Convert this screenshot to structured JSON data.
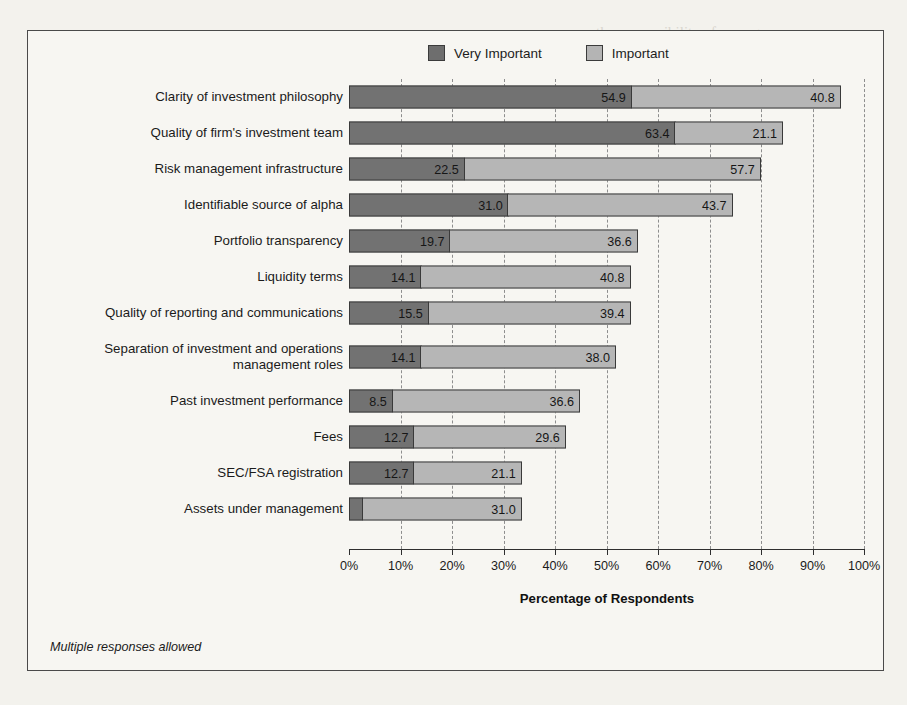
{
  "legend": {
    "items": [
      {
        "label": "Very Important",
        "color": "#727272"
      },
      {
        "label": "Important",
        "color": "#b6b6b6"
      }
    ]
  },
  "footnote": "Multiple responses allowed",
  "chart_data": {
    "type": "bar",
    "orientation": "horizontal",
    "stacked": true,
    "title": "",
    "xlabel": "Percentage of Respondents",
    "ylabel": "",
    "xlim": [
      0,
      100
    ],
    "xticks": [
      "0%",
      "10%",
      "20%",
      "30%",
      "40%",
      "50%",
      "60%",
      "70%",
      "80%",
      "90%",
      "100%"
    ],
    "xtick_values": [
      0,
      10,
      20,
      30,
      40,
      50,
      60,
      70,
      80,
      90,
      100
    ],
    "grid": "vertical-dashed",
    "legend_position": "top-center",
    "categories": [
      "Clarity of investment philosophy",
      "Quality of firm's investment team",
      "Risk management infrastructure",
      "Identifiable source of alpha",
      "Portfolio transparency",
      "Liquidity terms",
      "Quality of reporting and communications",
      "Separation of investment and operations management roles",
      "Past investment performance",
      "Fees",
      "SEC/FSA registration",
      "Assets under management"
    ],
    "series": [
      {
        "name": "Very Important",
        "color": "#727272",
        "values": [
          54.9,
          63.4,
          22.5,
          31.0,
          19.7,
          14.1,
          15.5,
          14.1,
          8.5,
          12.7,
          12.7,
          2.8
        ],
        "labels": [
          "54.9",
          "63.4",
          "22.5",
          "31.0",
          "19.7",
          "14.1",
          "15.5",
          "14.1",
          "8.5",
          "12.7",
          "12.7",
          ""
        ]
      },
      {
        "name": "Important",
        "color": "#b6b6b6",
        "values": [
          40.8,
          21.1,
          57.7,
          43.7,
          36.6,
          40.8,
          39.4,
          38.0,
          36.6,
          29.6,
          21.1,
          31.0
        ],
        "labels": [
          "40.8",
          "21.1",
          "57.7",
          "43.7",
          "36.6",
          "40.8",
          "39.4",
          "38.0",
          "36.6",
          "29.6",
          "21.1",
          "31.0"
        ]
      }
    ]
  },
  "bleed_text": [
    {
      "t": "the responsibility of manager",
      "x": 596,
      "y": 24,
      "s": 15
    },
    {
      "t": "Public funds",
      "x": 600,
      "y": 92,
      "s": 15
    },
    {
      "t": "or assets of the",
      "x": 612,
      "y": 152,
      "s": 15
    },
    {
      "t": "such that the",
      "x": 600,
      "y": 212,
      "s": 15
    },
    {
      "t": "(DIP) have required",
      "x": 596,
      "y": 268,
      "s": 15
    },
    {
      "t": "operational risk",
      "x": 598,
      "y": 310,
      "s": 15
    },
    {
      "t": "BUILDING A PROGRAM",
      "x": 596,
      "y": 424,
      "s": 18
    },
    {
      "t": "Risk Management Program",
      "x": 596,
      "y": 468,
      "s": 15
    },
    {
      "t": "Due diligence",
      "x": 600,
      "y": 556,
      "s": 15
    }
  ]
}
